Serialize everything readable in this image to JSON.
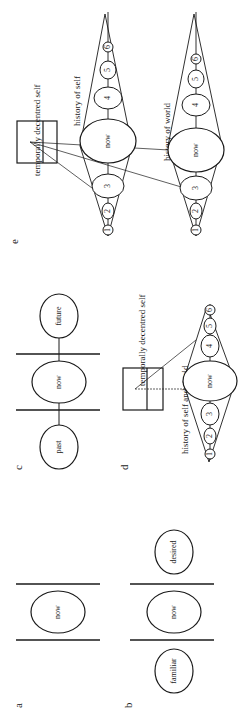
{
  "figure": {
    "orientation": "rotated 90 degrees counter-clockwise",
    "panels": {
      "a": {
        "label": "a",
        "nodes": [
          "now"
        ]
      },
      "b": {
        "label": "b",
        "nodes": [
          "familiar",
          "now",
          "desired"
        ]
      },
      "c": {
        "label": "c",
        "nodes": [
          "past",
          "now",
          "future"
        ]
      },
      "d": {
        "label": "d",
        "caption_history": "history of self and world",
        "caption_self": "temporally decentred self",
        "nodes": [
          "1",
          "2",
          "3",
          "now",
          "4",
          "5",
          "6"
        ]
      },
      "e": {
        "label": "e",
        "caption_self": "temporally decentred self",
        "caption_history_self": "history of self",
        "caption_history_world": "history of world",
        "self_nodes": [
          "1",
          "2",
          "3",
          "now",
          "4",
          "5",
          "6"
        ],
        "world_nodes": [
          "1",
          "2",
          "3",
          "now",
          "4",
          "5",
          "6"
        ]
      }
    }
  }
}
